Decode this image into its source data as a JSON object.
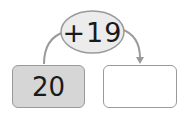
{
  "diagram": {
    "operation": "+19",
    "start_value": "20",
    "result_value": "",
    "colors": {
      "start_box_fill": "#d6d6d6",
      "result_box_fill": "#ffffff",
      "ellipse_fill": "#ececec",
      "stroke": "#9a9a9a"
    }
  }
}
